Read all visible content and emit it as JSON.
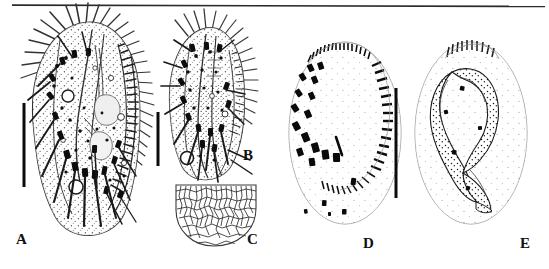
{
  "figure": {
    "type": "scientific-illustration-plate",
    "background_color": "#ffffff",
    "ink_color": "#111111",
    "top_rule": {
      "present": true,
      "x1": 12,
      "x2": 545,
      "y": 5,
      "thickness": 1.6
    },
    "panel_count": 5
  },
  "panels": [
    {
      "id": "A",
      "label": "A",
      "caption_text": "A",
      "description": "ventral view of whole cell with cirri, marginal cilia and adoral zone of membranelles",
      "label_x": 16,
      "label_y": 232,
      "scale_bar": {
        "present": true,
        "x": 24,
        "y_top": 103,
        "y_bottom": 187,
        "thickness": 3
      }
    },
    {
      "id": "B",
      "label": "B",
      "caption_text": "B",
      "description": "dorsal view of whole cell with bristles and contractile vacuole",
      "label_x": 243,
      "label_y": 148,
      "scale_bar": {
        "present": true,
        "x": 158,
        "y_top": 112,
        "y_bottom": 166,
        "thickness": 3
      }
    },
    {
      "id": "C",
      "label": "C",
      "caption_text": "C",
      "description": "detail of posterior cortical reticulate polygonal pattern",
      "label_x": 247,
      "label_y": 232,
      "scale_bar": {
        "present": false
      }
    },
    {
      "id": "D",
      "label": "D",
      "caption_text": "D",
      "description": "infraciliature of ventral side showing adoral zone of membranelles and cirral pattern",
      "label_x": 363,
      "label_y": 236,
      "scale_bar": {
        "present": false
      }
    },
    {
      "id": "E",
      "label": "E",
      "caption_text": "E",
      "description": "nuclear apparatus, C-shaped stippled macronucleus with micronuclei",
      "label_x": 520,
      "label_y": 236,
      "scale_bar": {
        "present": false
      }
    }
  ],
  "shared_scale_bar": {
    "present": true,
    "description": "vertical scale bar between panels D and E",
    "x": 396,
    "y_top": 88,
    "y_bottom": 198,
    "thickness": 3
  },
  "colors": {
    "ink": "#111111",
    "outline": "#4a4a4a",
    "faint": "#8d8d8d",
    "paper": "#ffffff"
  }
}
